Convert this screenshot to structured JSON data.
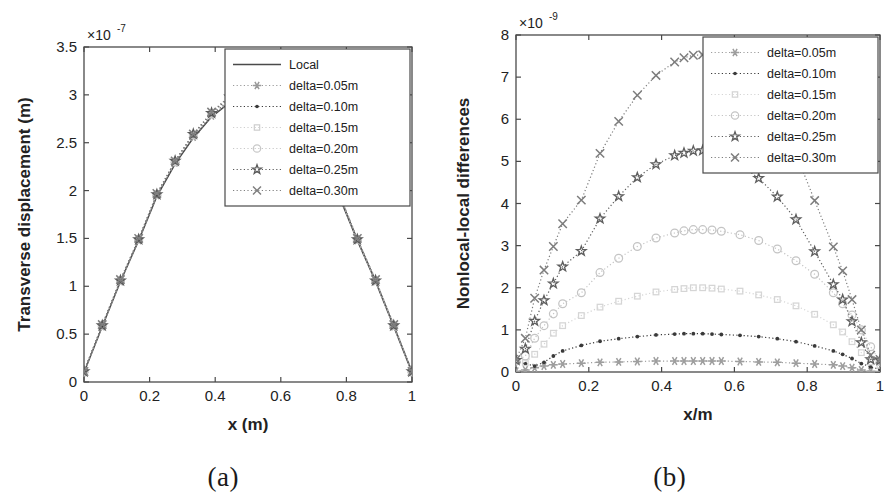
{
  "figure": {
    "panels": [
      {
        "caption": "(a)",
        "chart_key": "panel_a"
      },
      {
        "caption": "(b)",
        "chart_key": "panel_b"
      }
    ]
  },
  "chart_data": [
    {
      "id": "panel_a",
      "type": "line",
      "title": "",
      "xlabel": "x (m)",
      "ylabel": "Transverse displacement (m)",
      "xlim": [
        0,
        1
      ],
      "ylim": [
        0,
        3.5
      ],
      "xticks": [
        0,
        0.2,
        0.4,
        0.6,
        0.8,
        1
      ],
      "xticklabels": [
        "0",
        "0.2",
        "0.4",
        "0.6",
        "0.8",
        "1"
      ],
      "yticks": [
        0,
        0.5,
        1,
        1.5,
        2,
        2.5,
        3,
        3.5
      ],
      "yticklabels": [
        "0",
        "0.5",
        "1",
        "1.5",
        "2",
        "2.5",
        "3",
        "3.5"
      ],
      "y_exponent_mantissa": "×10",
      "y_exponent_power": "-7",
      "grid": false,
      "legend_position": "top-right",
      "x": [
        0.0,
        0.0556,
        0.1111,
        0.1667,
        0.2222,
        0.2778,
        0.3333,
        0.3889,
        0.4444,
        0.5,
        0.5556,
        0.6111,
        0.6667,
        0.7222,
        0.7778,
        0.8333,
        0.8889,
        0.9444,
        1.0
      ],
      "series": [
        {
          "name": "Local",
          "marker": "none",
          "linestyle": "solid",
          "color": "#4a4a4a",
          "values": [
            0.1,
            0.58,
            1.05,
            1.48,
            1.94,
            2.28,
            2.55,
            2.77,
            2.92,
            2.97,
            2.92,
            2.77,
            2.55,
            2.28,
            1.94,
            1.48,
            1.05,
            0.58,
            0.1
          ]
        },
        {
          "name": "delta=0.05m",
          "marker": "asterisk",
          "linestyle": "dotted",
          "color": "#9a9a9a",
          "values": [
            0.1,
            0.58,
            1.05,
            1.48,
            1.95,
            2.29,
            2.56,
            2.78,
            2.93,
            2.99,
            2.93,
            2.78,
            2.56,
            2.29,
            1.95,
            1.48,
            1.05,
            0.58,
            0.1
          ]
        },
        {
          "name": "delta=0.10m",
          "marker": "dot",
          "linestyle": "dotted",
          "color": "#3a3a3a",
          "values": [
            0.11,
            0.59,
            1.06,
            1.49,
            1.95,
            2.29,
            2.57,
            2.79,
            2.95,
            3.0,
            2.95,
            2.79,
            2.57,
            2.29,
            1.95,
            1.49,
            1.06,
            0.59,
            0.11
          ]
        },
        {
          "name": "delta=0.15m",
          "marker": "square",
          "linestyle": "dotted",
          "color": "#cfcfcf",
          "values": [
            0.11,
            0.59,
            1.06,
            1.49,
            1.96,
            2.3,
            2.58,
            2.8,
            2.96,
            3.01,
            2.96,
            2.8,
            2.58,
            2.3,
            1.96,
            1.49,
            1.06,
            0.59,
            0.11
          ]
        },
        {
          "name": "delta=0.20m",
          "marker": "circle",
          "linestyle": "dotted",
          "color": "#c8c8c8",
          "values": [
            0.11,
            0.59,
            1.06,
            1.49,
            1.96,
            2.3,
            2.58,
            2.8,
            2.97,
            3.02,
            2.97,
            2.8,
            2.58,
            2.3,
            1.96,
            1.49,
            1.06,
            0.59,
            0.11
          ]
        },
        {
          "name": "delta=0.25m",
          "marker": "pentagram",
          "linestyle": "dotted",
          "color": "#5a5a5a",
          "values": [
            0.11,
            0.59,
            1.06,
            1.49,
            1.96,
            2.31,
            2.59,
            2.81,
            2.98,
            3.03,
            2.98,
            2.81,
            2.59,
            2.31,
            1.96,
            1.49,
            1.06,
            0.59,
            0.11
          ]
        },
        {
          "name": "delta=0.30m",
          "marker": "cross",
          "linestyle": "dotted",
          "color": "#808080",
          "values": [
            0.11,
            0.6,
            1.07,
            1.5,
            1.97,
            2.31,
            2.59,
            2.82,
            2.99,
            3.04,
            2.99,
            2.82,
            2.59,
            2.31,
            1.97,
            1.5,
            1.07,
            0.6,
            0.11
          ]
        }
      ]
    },
    {
      "id": "panel_b",
      "type": "line",
      "title": "",
      "xlabel": "x/m",
      "ylabel": "Nonlocal-local differences",
      "xlim": [
        0,
        1
      ],
      "ylim": [
        0,
        8
      ],
      "xticks": [
        0,
        0.2,
        0.4,
        0.6,
        0.8,
        1
      ],
      "xticklabels": [
        "0",
        "0.2",
        "0.4",
        "0.6",
        "0.8",
        "1"
      ],
      "yticks": [
        0,
        1,
        2,
        3,
        4,
        5,
        6,
        7,
        8
      ],
      "yticklabels": [
        "0",
        "1",
        "2",
        "3",
        "4",
        "5",
        "6",
        "7",
        "8"
      ],
      "y_exponent_mantissa": "×10",
      "y_exponent_power": "-9",
      "grid": false,
      "legend_position": "top-right",
      "x": [
        0.0,
        0.0256,
        0.0513,
        0.0769,
        0.1026,
        0.1282,
        0.1795,
        0.2308,
        0.2821,
        0.3333,
        0.3846,
        0.4359,
        0.4615,
        0.4872,
        0.5128,
        0.5385,
        0.5641,
        0.6154,
        0.6667,
        0.7179,
        0.7692,
        0.8205,
        0.8718,
        0.8974,
        0.9231,
        0.9487,
        0.9744,
        1.0
      ],
      "series": [
        {
          "name": "delta=0.05m",
          "marker": "asterisk",
          "linestyle": "dotted",
          "color": "#9e9e9e",
          "values": [
            0.02,
            0.05,
            0.1,
            0.14,
            0.17,
            0.19,
            0.21,
            0.23,
            0.24,
            0.25,
            0.26,
            0.26,
            0.26,
            0.26,
            0.26,
            0.26,
            0.26,
            0.25,
            0.24,
            0.23,
            0.21,
            0.19,
            0.17,
            0.14,
            0.1,
            0.05,
            0.02,
            0.01
          ]
        },
        {
          "name": "delta=0.10m",
          "marker": "dot",
          "linestyle": "dotted",
          "color": "#3a3a3a",
          "values": [
            0.27,
            0.2,
            0.14,
            0.23,
            0.38,
            0.5,
            0.63,
            0.73,
            0.79,
            0.84,
            0.88,
            0.9,
            0.91,
            0.91,
            0.91,
            0.9,
            0.89,
            0.87,
            0.84,
            0.79,
            0.72,
            0.62,
            0.5,
            0.42,
            0.32,
            0.2,
            0.12,
            0.06
          ]
        },
        {
          "name": "delta=0.15m",
          "marker": "square",
          "linestyle": "dotted",
          "color": "#d5d5d5",
          "values": [
            0.25,
            0.22,
            0.42,
            0.66,
            0.92,
            1.1,
            1.34,
            1.54,
            1.68,
            1.8,
            1.9,
            1.96,
            1.98,
            2.0,
            2.0,
            1.99,
            1.97,
            1.92,
            1.83,
            1.72,
            1.57,
            1.37,
            1.12,
            0.95,
            0.72,
            0.46,
            0.24,
            0.16
          ]
        },
        {
          "name": "delta=0.20m",
          "marker": "circle",
          "linestyle": "dotted",
          "color": "#c4c4c4",
          "values": [
            0.26,
            0.38,
            0.8,
            1.1,
            1.38,
            1.62,
            1.88,
            2.36,
            2.7,
            2.98,
            3.18,
            3.3,
            3.35,
            3.38,
            3.38,
            3.37,
            3.34,
            3.26,
            3.12,
            2.92,
            2.64,
            2.32,
            1.88,
            1.62,
            1.35,
            1.0,
            0.6,
            0.25
          ]
        },
        {
          "name": "delta=0.25m",
          "marker": "pentagram",
          "linestyle": "dotted",
          "color": "#5e5e5e",
          "values": [
            0.28,
            0.55,
            1.21,
            1.7,
            2.1,
            2.5,
            2.87,
            3.64,
            4.17,
            4.62,
            4.93,
            5.14,
            5.2,
            5.25,
            5.26,
            5.24,
            5.15,
            4.93,
            4.6,
            4.16,
            3.62,
            2.86,
            2.08,
            1.72,
            1.2,
            0.7,
            0.3,
            0.28
          ]
        },
        {
          "name": "delta=0.30m",
          "marker": "cross",
          "linestyle": "dotted",
          "color": "#7d7d7d",
          "values": [
            0.3,
            0.8,
            1.75,
            2.42,
            2.98,
            3.52,
            4.08,
            5.19,
            5.95,
            6.57,
            7.04,
            7.36,
            7.46,
            7.52,
            7.53,
            7.5,
            7.36,
            7.03,
            6.55,
            5.93,
            5.18,
            4.07,
            2.97,
            2.4,
            1.72,
            1.0,
            0.4,
            0.3
          ]
        }
      ]
    }
  ]
}
